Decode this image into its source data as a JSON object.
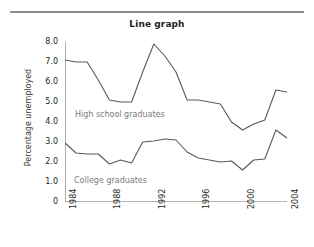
{
  "figure": {
    "title": "Line graph",
    "ylabel": "Percentage unemployed"
  },
  "annotations": {
    "high_school": "High school graduates",
    "college": "College graduates"
  },
  "axis": {
    "y_ticks": [
      "8.0",
      "7.0",
      "6.0",
      "5.0",
      "4.0",
      "3.0",
      "2.0",
      "1.0",
      "0"
    ],
    "x_ticks": [
      "1984",
      "1988",
      "1992",
      "1996",
      "2000",
      "2004"
    ]
  },
  "colors": {
    "line": "#58595b",
    "axis": "#6d6e71",
    "rule": "#8d8d8d",
    "annotation_text": "#7b7b7b",
    "title_text": "#231f20"
  },
  "chart_data": {
    "type": "line",
    "title": "Line graph",
    "xlabel": "",
    "ylabel": "Percentage unemployed",
    "xlim": [
      1984,
      2004
    ],
    "ylim": [
      0,
      8
    ],
    "grid": false,
    "legend": "inline-annotations",
    "x": [
      1984,
      1985,
      1986,
      1987,
      1988,
      1989,
      1990,
      1991,
      1992,
      1993,
      1994,
      1995,
      1996,
      1997,
      1998,
      1999,
      2000,
      2001,
      2002,
      2003,
      2004
    ],
    "xtick_labels": [
      "1984",
      "1988",
      "1992",
      "1996",
      "2000",
      "2004"
    ],
    "xtick_values": [
      1984,
      1988,
      1992,
      1996,
      2000,
      2004
    ],
    "ytick_values": [
      0,
      1,
      2,
      3,
      4,
      5,
      6,
      7,
      8
    ],
    "ytick_labels": [
      "0",
      "1.0",
      "2.0",
      "3.0",
      "4.0",
      "5.0",
      "6.0",
      "7.0",
      "8.0"
    ],
    "series": [
      {
        "name": "High school graduates",
        "values": [
          7.1,
          7.0,
          7.0,
          6.1,
          5.1,
          5.0,
          5.0,
          6.5,
          7.9,
          7.3,
          6.5,
          5.1,
          5.1,
          5.0,
          4.9,
          4.0,
          3.6,
          3.9,
          4.1,
          5.6,
          5.5
        ]
      },
      {
        "name": "College graduates",
        "values": [
          2.95,
          2.45,
          2.4,
          2.4,
          1.9,
          2.1,
          1.95,
          3.0,
          3.05,
          3.15,
          3.1,
          2.5,
          2.2,
          2.1,
          2.0,
          2.05,
          1.6,
          2.1,
          2.15,
          3.6,
          3.2
        ]
      }
    ]
  }
}
